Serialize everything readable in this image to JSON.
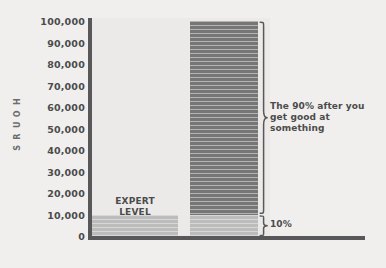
{
  "chart_data": {
    "type": "bar",
    "title": "",
    "subtitle": "",
    "xlabel": "",
    "ylabel": "HOURS",
    "ylim": [
      0,
      100000
    ],
    "grid": false,
    "legend": "none",
    "ytick_labels": [
      "100,000",
      "90,000",
      "80,000",
      "70,000",
      "60,000",
      "50,000",
      "40,000",
      "30,000",
      "20,000",
      "10,000",
      "0"
    ],
    "ytick_values": [
      100000,
      90000,
      80000,
      70000,
      60000,
      50000,
      40000,
      30000,
      20000,
      10000,
      0
    ],
    "categories": [
      "Expert level",
      "Total mastery"
    ],
    "values": [
      10000,
      100000
    ],
    "series": [
      {
        "name": "hours",
        "values": [
          10000,
          100000
        ]
      }
    ],
    "segments": [
      {
        "category": "Expert level",
        "label": "EXPERT LEVEL",
        "from": 0,
        "to": 10000,
        "color": "#bcbcbc"
      },
      {
        "category": "Total mastery",
        "label": "10%",
        "from": 0,
        "to": 10000,
        "color": "#bcbcbc"
      },
      {
        "category": "Total mastery",
        "label": "The 90% after you get good at something",
        "from": 10000,
        "to": 100000,
        "color": "#7c7c7c"
      }
    ],
    "annotations": [
      {
        "name": "expert-level",
        "text": "EXPERT LEVEL"
      },
      {
        "name": "ninety-percent",
        "text": "The 90% after you get good at something"
      },
      {
        "name": "ten-percent",
        "text": "10%"
      }
    ],
    "colors": {
      "background": "#f0efee",
      "plot_background": "#eceae9",
      "axis": "#58585a",
      "bar_light": "#bcbcbc",
      "bar_dark": "#7c7c7c",
      "text": "#4b4b4b"
    }
  },
  "axis": {
    "y_title": "HOURS",
    "y_title_letters": [
      "H",
      "O",
      "U",
      "R",
      "S"
    ],
    "ticks": [
      {
        "label": "100,000"
      },
      {
        "label": "90,000"
      },
      {
        "label": "80,000"
      },
      {
        "label": "70,000"
      },
      {
        "label": "60,000"
      },
      {
        "label": "50,000"
      },
      {
        "label": "40,000"
      },
      {
        "label": "30,000"
      },
      {
        "label": "20,000"
      },
      {
        "label": "10,000"
      },
      {
        "label": "0"
      }
    ]
  },
  "labels": {
    "expert_line1": "EXPERT",
    "expert_line2": "LEVEL",
    "annot_90": "The 90% after you get good at something",
    "annot_10": "10%"
  }
}
